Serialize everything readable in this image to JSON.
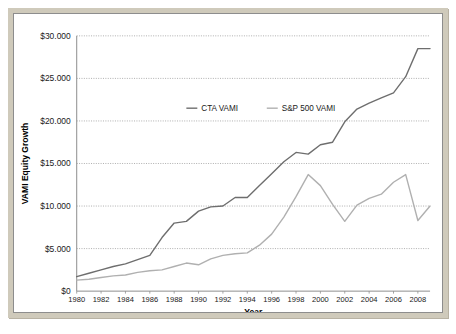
{
  "chart_data": {
    "type": "line",
    "title": "",
    "xlabel": "Year",
    "ylabel": "VAMI Equity Growth",
    "xlim": [
      1980,
      2009
    ],
    "ylim": [
      0,
      30000
    ],
    "grid": true,
    "legend_position": "upper-center-inside",
    "ytick_labels": [
      "$30.000",
      "$25.000",
      "$20.000",
      "$15.000",
      "$10.000",
      "$5.000",
      "$0"
    ],
    "ytick_values": [
      30000,
      25000,
      20000,
      15000,
      10000,
      5000,
      0
    ],
    "xtick_labels": [
      "1980",
      "1982",
      "1984",
      "1986",
      "1988",
      "1990",
      "1992",
      "1994",
      "1996",
      "1998",
      "2000",
      "2002",
      "2004",
      "2006",
      "2008"
    ],
    "xtick_values": [
      1980,
      1982,
      1984,
      1986,
      1988,
      1990,
      1992,
      1994,
      1996,
      1998,
      2000,
      2002,
      2004,
      2006,
      2008
    ],
    "x": [
      1980,
      1981,
      1982,
      1983,
      1984,
      1985,
      1986,
      1987,
      1988,
      1989,
      1990,
      1991,
      1992,
      1993,
      1994,
      1995,
      1996,
      1997,
      1998,
      1999,
      2000,
      2001,
      2002,
      2003,
      2004,
      2005,
      2006,
      2007,
      2008,
      2009
    ],
    "series": [
      {
        "name": "CTA VAMI",
        "color": "#6e6e6e",
        "values": [
          1700,
          2100,
          2500,
          2900,
          3200,
          3700,
          4200,
          6300,
          8000,
          8200,
          9400,
          9900,
          10000,
          11000,
          11000,
          12400,
          13800,
          15200,
          16300,
          16100,
          17200,
          17500,
          19900,
          21400,
          22100,
          22700,
          23300,
          25200,
          28500,
          28500
        ]
      },
      {
        "name": "S&P 500 VAMI",
        "color": "#b0b0b0",
        "values": [
          1300,
          1400,
          1600,
          1800,
          1900,
          2200,
          2400,
          2500,
          2900,
          3300,
          3100,
          3800,
          4200,
          4400,
          4500,
          5400,
          6700,
          8700,
          11100,
          13700,
          12400,
          10200,
          8200,
          10100,
          10900,
          11400,
          12800,
          13700,
          8300,
          10000
        ]
      }
    ],
    "legend": [
      "CTA VAMI",
      "S&P 500 VAMI"
    ]
  },
  "style": {
    "bezel_color": "#cfcabb",
    "plot_background": "#ffffff",
    "axis_color": "#8d8d8d",
    "grid_color": "#9a9a9a",
    "text_color": "#1a1a1a"
  }
}
